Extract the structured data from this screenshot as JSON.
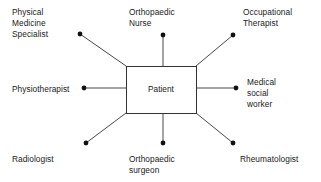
{
  "diagram": {
    "center": {
      "label": "Patient",
      "box": {
        "x": 126,
        "y": 66,
        "width": 70,
        "height": 47
      }
    },
    "line_color": "#333333",
    "dot_color": "#111111",
    "background_color": "#ffffff",
    "text_color": "#1a1a1a",
    "nodes": [
      {
        "id": "physical-medicine-specialist",
        "label_lines": [
          "Physical",
          "Medicine",
          "Specialist"
        ],
        "label_x": 12,
        "label_y": 7,
        "dot": {
          "x": 80,
          "y": 34
        },
        "line_from": {
          "x": 126,
          "y": 66
        }
      },
      {
        "id": "orthopaedic-nurse",
        "label_lines": [
          "Orthopaedic",
          "Nurse"
        ],
        "label_x": 129,
        "label_y": 7,
        "dot": {
          "x": 163,
          "y": 35
        },
        "line_from": {
          "x": 163,
          "y": 66
        }
      },
      {
        "id": "occupational-therapist",
        "label_lines": [
          "Occupational",
          "Therapist"
        ],
        "label_x": 243,
        "label_y": 7,
        "dot": {
          "x": 233,
          "y": 35
        },
        "line_from": {
          "x": 196,
          "y": 66
        }
      },
      {
        "id": "physiotherapist",
        "label_lines": [
          "Physiotherapist"
        ],
        "label_x": 12,
        "label_y": 84,
        "dot": {
          "x": 84,
          "y": 88
        },
        "line_from": {
          "x": 126,
          "y": 88
        }
      },
      {
        "id": "medical-social-worker",
        "label_lines": [
          "Medical",
          "social",
          "worker"
        ],
        "label_x": 247,
        "label_y": 77,
        "dot": {
          "x": 236,
          "y": 88
        },
        "line_from": {
          "x": 196,
          "y": 88
        }
      },
      {
        "id": "radiologist",
        "label_lines": [
          "Radiologist"
        ],
        "label_x": 12,
        "label_y": 154,
        "dot": {
          "x": 86,
          "y": 143
        },
        "line_from": {
          "x": 126,
          "y": 113
        }
      },
      {
        "id": "orthopaedic-surgeon",
        "label_lines": [
          "Orthopaedic",
          "surgeon"
        ],
        "label_x": 129,
        "label_y": 154,
        "dot": {
          "x": 163,
          "y": 143
        },
        "line_from": {
          "x": 163,
          "y": 113
        }
      },
      {
        "id": "rheumatologist",
        "label_lines": [
          "Rheumatologist"
        ],
        "label_x": 240,
        "label_y": 154,
        "dot": {
          "x": 233,
          "y": 143
        },
        "line_from": {
          "x": 196,
          "y": 113
        }
      }
    ]
  }
}
